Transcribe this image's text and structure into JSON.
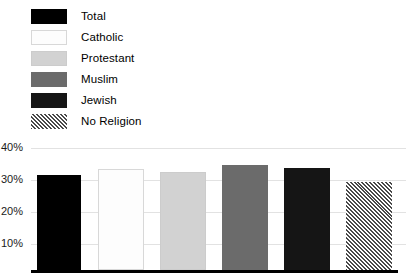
{
  "chart_data": {
    "type": "bar",
    "title": "",
    "subtitle": "",
    "xlabel": "",
    "ylabel": "",
    "categories": [
      "Total",
      "Catholic",
      "Protestant",
      "Muslim",
      "Jewish",
      "No Religion"
    ],
    "values": [
      31.0,
      33.0,
      32.0,
      34.5,
      33.5,
      28.8
    ],
    "value_labels": [
      "31%",
      "33%",
      "32%",
      "34.5%",
      "33.5%",
      "28.8%"
    ],
    "ylim": [
      0,
      43
    ],
    "ytick_values": [
      10,
      20,
      30,
      40
    ],
    "ytick_labels": [
      "10%",
      "20%",
      "30%",
      "40%"
    ],
    "xtick_labels": [],
    "grid": true,
    "grid_axis": "y",
    "legend_position": "top-left",
    "series": [
      {
        "name": "Share",
        "values": [
          31.0,
          33.0,
          32.0,
          34.5,
          33.5,
          28.8
        ]
      }
    ]
  },
  "legend": {
    "items": [
      {
        "label": "Total",
        "swatch": "solid-black",
        "color": "#000000"
      },
      {
        "label": "Catholic",
        "swatch": "white-outline",
        "color": "#fdfdfd"
      },
      {
        "label": "Protestant",
        "swatch": "light-gray",
        "color": "#d2d2d2"
      },
      {
        "label": "Muslim",
        "swatch": "medium-gray",
        "color": "#6b6b6b"
      },
      {
        "label": "Jewish",
        "swatch": "near-black",
        "color": "#151515"
      },
      {
        "label": "No Religion",
        "swatch": "hatched-checker",
        "color": "#4a4a4a"
      }
    ]
  },
  "axis": {
    "y_labels": [
      "40%",
      "30%",
      "20%",
      "10%"
    ],
    "baseline_color": "#000000",
    "gridline_color": "#e2e2e2"
  }
}
